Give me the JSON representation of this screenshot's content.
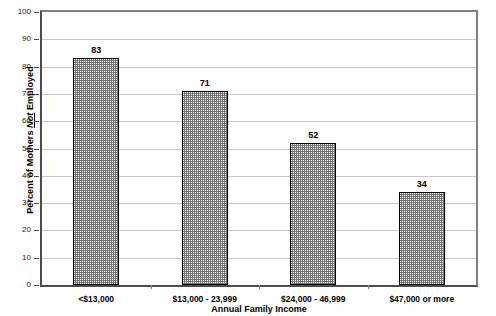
{
  "chart_data": {
    "type": "bar",
    "title": "",
    "subtitle": "",
    "categories": [
      "<$13,000",
      "$13,000 - 23,999",
      "$24,000 - 46,999",
      "$47,000 or more"
    ],
    "values": [
      83,
      71,
      52,
      34
    ],
    "series": [
      {
        "name": "Percent of Mothers Not Employed",
        "values": [
          83,
          71,
          52,
          34
        ]
      }
    ],
    "xlabel": "Annual Family Income",
    "ylabel_parts": {
      "before": "Percent of Mothers ",
      "emphasis": "Not",
      "after": " Employed"
    },
    "ylabel": "Percent of Mothers Not Employed",
    "ylim": [
      0,
      100
    ],
    "ytick_step": 10,
    "yticks": [
      0,
      10,
      20,
      30,
      40,
      50,
      60,
      70,
      80,
      90,
      100
    ],
    "ytick_labels": [
      "0",
      "10",
      "20",
      "30",
      "40",
      "50",
      "60",
      "70",
      "80",
      "90",
      "100"
    ],
    "data_labels": [
      "83",
      "71",
      "52",
      "34"
    ],
    "grid": true,
    "grid_axis": "y",
    "legend": false,
    "legend_position": "none",
    "bar_fill": "stippled-gray-checker",
    "bar_border_color": "#000000",
    "grid_color": "#c8c8c8",
    "axis_color": "#4d4d4d",
    "plot_background": "#ffffff"
  }
}
